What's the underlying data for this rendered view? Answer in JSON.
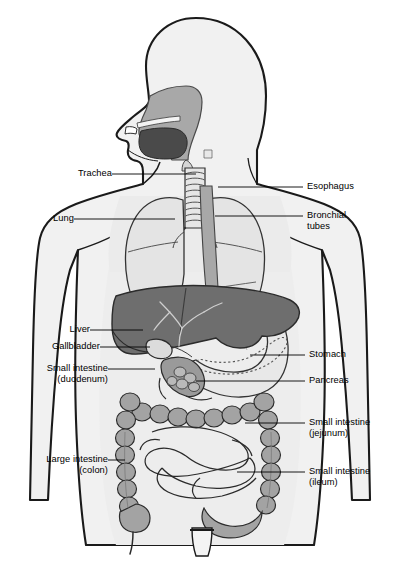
{
  "figure": {
    "view": "anterior body outline with head in profile",
    "background": "#ffffff",
    "palette": {
      "outline": "#1a1a1a",
      "body_fill": "#f1f1f1",
      "torso_cavity_fill": "#ededed",
      "organ_light": "#e2e2e2",
      "organ_mid": "#a8a8a8",
      "organ_dark": "#6e6e6e",
      "organ_darkest": "#4a4a4a",
      "leader_line": "#000000",
      "label_text": "#000000"
    }
  },
  "labels": {
    "left": [
      {
        "id": "trachea",
        "text": "Trachea",
        "sub": "",
        "x": 68,
        "y": 164,
        "anchor_x": 112,
        "line_to_x": 196,
        "line_y": 174
      },
      {
        "id": "lung",
        "text": "Lung",
        "sub": "",
        "x": 30,
        "y": 209,
        "anchor_x": 74,
        "line_to_x": 175,
        "line_y": 219
      },
      {
        "id": "liver",
        "text": "Liver",
        "sub": "",
        "x": 58,
        "y": 320,
        "anchor_x": 90,
        "line_to_x": 143,
        "line_y": 330
      },
      {
        "id": "gallbladder",
        "text": "Gallbladder",
        "sub": "",
        "x": 32,
        "y": 337,
        "anchor_x": 100,
        "line_to_x": 150,
        "line_y": 347
      },
      {
        "id": "duodenum",
        "text": "Small intestine",
        "sub": "(duodenum)",
        "x": 18,
        "y": 359,
        "anchor_x": 108,
        "line_to_x": 155,
        "line_y": 369
      },
      {
        "id": "colon",
        "text": "Large intestine",
        "sub": "(colon)",
        "x": 14,
        "y": 450,
        "anchor_x": 108,
        "line_to_x": 125,
        "line_y": 460
      }
    ],
    "right": [
      {
        "id": "esophagus",
        "text": "Esophagus",
        "sub": "",
        "x": 305,
        "y": 178,
        "anchor_x": 303,
        "line_from_x": 218,
        "line_y": 187
      },
      {
        "id": "bronchial_tubes",
        "text": "Bronchial",
        "sub": "tubes",
        "x": 305,
        "y": 207,
        "anchor_x": 303,
        "line_from_x": 215,
        "line_y": 216
      },
      {
        "id": "stomach",
        "text": "Stomach",
        "sub": "",
        "x": 307,
        "y": 346,
        "anchor_x": 305,
        "line_from_x": 250,
        "line_y": 355
      },
      {
        "id": "pancreas",
        "text": "Pancreas",
        "sub": "",
        "x": 307,
        "y": 372,
        "anchor_x": 305,
        "line_from_x": 196,
        "line_y": 381
      },
      {
        "id": "jejunum",
        "text": "Small intestine",
        "sub": "(jejunum)",
        "x": 307,
        "y": 414,
        "anchor_x": 305,
        "line_from_x": 245,
        "line_y": 423
      },
      {
        "id": "ileum",
        "text": "Small intestine",
        "sub": "(ileum)",
        "x": 307,
        "y": 463,
        "anchor_x": 305,
        "line_from_x": 237,
        "line_y": 472
      }
    ]
  },
  "organs": [
    {
      "name": "nasal-and-oral-cavity",
      "shade": "organ_mid"
    },
    {
      "name": "tongue-and-pharynx",
      "shade": "organ_darkest"
    },
    {
      "name": "trachea",
      "shade": "organ_light"
    },
    {
      "name": "left-lung",
      "shade": "organ_light"
    },
    {
      "name": "right-lung",
      "shade": "organ_light"
    },
    {
      "name": "esophagus",
      "shade": "organ_mid"
    },
    {
      "name": "liver",
      "shade": "organ_dark"
    },
    {
      "name": "gallbladder",
      "shade": "organ_light"
    },
    {
      "name": "stomach",
      "shade": "organ_light"
    },
    {
      "name": "pancreas",
      "shade": "dashed-outline"
    },
    {
      "name": "duodenum",
      "shade": "organ_mid"
    },
    {
      "name": "large-intestine",
      "shade": "organ_mid"
    },
    {
      "name": "small-intestine-coils",
      "shade": "organ_light"
    },
    {
      "name": "rectum",
      "shade": "organ_mid"
    }
  ],
  "watermark": {
    "text": ""
  }
}
